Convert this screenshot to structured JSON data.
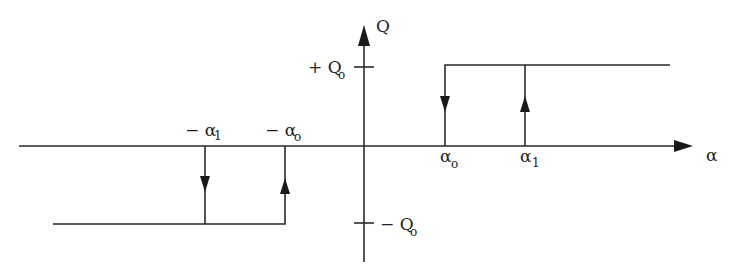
{
  "diagram": {
    "type": "hysteresis-relay",
    "axes": {
      "x_label": "α",
      "y_label": "Q"
    },
    "y_ticks": [
      {
        "sign": "+",
        "symbol": "Q",
        "subscript": "o",
        "text": "+ Q"
      },
      {
        "sign": "−",
        "symbol": "Q",
        "subscript": "o",
        "text": "− Q"
      }
    ],
    "x_ticks": [
      {
        "prefix": "−",
        "symbol": "α",
        "subscript": "1",
        "text": "− α"
      },
      {
        "prefix": "−",
        "symbol": "α",
        "subscript": "o",
        "text": "− α"
      },
      {
        "prefix": "",
        "symbol": "α",
        "subscript": "o",
        "text": "α"
      },
      {
        "prefix": "",
        "symbol": "α",
        "subscript": "1",
        "text": "α"
      }
    ],
    "branches": [
      {
        "name": "upper-right",
        "description": "Q = +Q0 for α ≥ α0 (after switching up at α1)"
      },
      {
        "name": "lower-left",
        "description": "Q = −Q0 for α ≤ −α0 (after switching down at −α1)"
      }
    ],
    "transitions": [
      {
        "at": "α0",
        "direction": "down"
      },
      {
        "at": "α1",
        "direction": "up"
      },
      {
        "at": "−α1",
        "direction": "down"
      },
      {
        "at": "−α0",
        "direction": "up"
      }
    ]
  }
}
